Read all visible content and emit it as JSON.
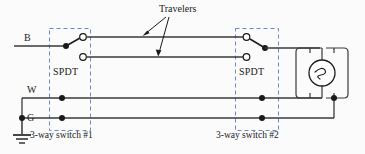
{
  "diagram": {
    "background_color": "#fbfbfb",
    "wire_color": "#3a3a3a",
    "box_color": "#6f86c9",
    "labels": {
      "hot": "B",
      "neutral": "W",
      "ground": "G",
      "travelers": "Travelers",
      "switch1_type": "SPDT",
      "switch2_type": "SPDT",
      "switch1_name": "3-way switch #1",
      "switch2_name": "3-way switch #2"
    },
    "components": {
      "ground_symbol": "earth-ground",
      "lamp_symbol": "incandescent-lamp",
      "switch1_position": "upper-contact-closed",
      "switch2_position": "upper-contact-closed"
    },
    "wires": {
      "hot_label": "B",
      "neutral_label": "W",
      "ground_label": "G",
      "traveler_count": 2
    }
  }
}
